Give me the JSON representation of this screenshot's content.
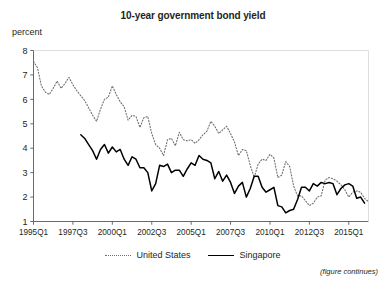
{
  "figure": {
    "title": "10-year government bond yield",
    "unit_label": "percent",
    "note": "(figure continues)"
  },
  "legend": {
    "items": [
      {
        "label": "United States",
        "style": "dotted",
        "color": "#6d6e71"
      },
      {
        "label": "Singapore",
        "style": "solid",
        "color": "#000000"
      }
    ]
  },
  "chart_data": {
    "type": "line",
    "title": "10-year government bond yield",
    "xlabel": "",
    "ylabel": "percent",
    "ylim": [
      1,
      8
    ],
    "yticks": [
      1,
      2,
      3,
      4,
      5,
      6,
      7,
      8
    ],
    "grid": false,
    "legend_position": "bottom-center",
    "xtick_labels": [
      "1995Q1",
      "1997Q3",
      "2000Q1",
      "2002Q3",
      "2005Q1",
      "2007Q3",
      "2010Q1",
      "2012Q3",
      "2015Q1"
    ],
    "x_quarters": [
      "1995Q1",
      "1995Q2",
      "1995Q3",
      "1995Q4",
      "1996Q1",
      "1996Q2",
      "1996Q3",
      "1996Q4",
      "1997Q1",
      "1997Q2",
      "1997Q3",
      "1997Q4",
      "1998Q1",
      "1998Q2",
      "1998Q3",
      "1998Q4",
      "1999Q1",
      "1999Q2",
      "1999Q3",
      "1999Q4",
      "2000Q1",
      "2000Q2",
      "2000Q3",
      "2000Q4",
      "2001Q1",
      "2001Q2",
      "2001Q3",
      "2001Q4",
      "2002Q1",
      "2002Q2",
      "2002Q3",
      "2002Q4",
      "2003Q1",
      "2003Q2",
      "2003Q3",
      "2003Q4",
      "2004Q1",
      "2004Q2",
      "2004Q3",
      "2004Q4",
      "2005Q1",
      "2005Q2",
      "2005Q3",
      "2005Q4",
      "2006Q1",
      "2006Q2",
      "2006Q3",
      "2006Q4",
      "2007Q1",
      "2007Q2",
      "2007Q3",
      "2007Q4",
      "2008Q1",
      "2008Q2",
      "2008Q3",
      "2008Q4",
      "2009Q1",
      "2009Q2",
      "2009Q3",
      "2009Q4",
      "2010Q1",
      "2010Q2",
      "2010Q3",
      "2010Q4",
      "2011Q1",
      "2011Q2",
      "2011Q3",
      "2011Q4",
      "2012Q1",
      "2012Q2",
      "2012Q3",
      "2012Q4",
      "2013Q1",
      "2013Q2",
      "2013Q3",
      "2013Q4",
      "2014Q1",
      "2014Q2",
      "2014Q3",
      "2014Q4",
      "2015Q1",
      "2015Q2",
      "2015Q3",
      "2015Q4",
      "2016Q1",
      "2016Q2"
    ],
    "series": [
      {
        "name": "United States",
        "style": "dotted",
        "color": "#6d6e71",
        "start_index": 0,
        "values": [
          7.55,
          7.3,
          6.55,
          6.3,
          6.2,
          6.45,
          6.75,
          6.45,
          6.65,
          6.9,
          6.6,
          6.35,
          6.15,
          5.95,
          5.65,
          5.35,
          5.1,
          5.6,
          6.0,
          6.1,
          6.55,
          6.2,
          5.9,
          5.7,
          5.15,
          5.35,
          5.3,
          4.85,
          5.25,
          5.3,
          4.6,
          4.15,
          4.0,
          3.7,
          4.35,
          4.4,
          4.1,
          4.65,
          4.35,
          4.3,
          4.35,
          4.2,
          4.35,
          4.55,
          4.7,
          5.1,
          4.9,
          4.6,
          4.75,
          4.9,
          4.6,
          4.25,
          3.7,
          3.95,
          3.9,
          3.3,
          2.8,
          3.35,
          3.55,
          3.5,
          3.75,
          3.6,
          2.8,
          2.9,
          3.45,
          3.25,
          2.45,
          2.05,
          2.05,
          1.85,
          1.65,
          1.75,
          2.0,
          2.05,
          2.7,
          2.8,
          2.75,
          2.65,
          2.5,
          2.3,
          2.0,
          2.2,
          2.25,
          2.2,
          1.95,
          1.8
        ]
      },
      {
        "name": "Singapore",
        "style": "solid",
        "color": "#000000",
        "start_index": 12,
        "values": [
          4.55,
          4.4,
          4.15,
          3.9,
          3.55,
          3.95,
          4.15,
          3.8,
          4.05,
          3.85,
          3.95,
          3.55,
          3.3,
          3.65,
          3.55,
          3.2,
          3.2,
          3.0,
          2.25,
          2.55,
          3.3,
          3.25,
          3.35,
          3.0,
          3.1,
          3.1,
          2.85,
          3.15,
          3.4,
          3.3,
          3.7,
          3.55,
          3.5,
          3.4,
          2.75,
          3.05,
          2.65,
          2.9,
          2.6,
          2.15,
          2.45,
          2.6,
          2.0,
          2.35,
          2.85,
          2.85,
          2.4,
          2.2,
          2.3,
          2.4,
          1.65,
          1.6,
          1.35,
          1.45,
          1.5,
          1.9,
          2.4,
          2.4,
          2.25,
          2.55,
          2.45,
          2.6,
          2.55,
          2.6,
          2.55,
          2.1,
          2.35,
          2.5,
          2.55,
          2.45,
          1.95,
          2.0,
          1.75
        ]
      }
    ]
  }
}
